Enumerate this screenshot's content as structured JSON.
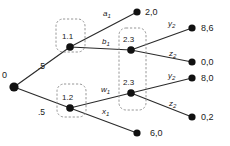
{
  "diagram": {
    "type": "extensive-form-game-tree",
    "root": {
      "label": "0",
      "x": 14,
      "y": 87
    },
    "chance_probabilities": [
      {
        "label": ".5",
        "x": 38,
        "y": 62,
        "branch": "root-to-1.1"
      },
      {
        "label": ".5",
        "x": 38,
        "y": 108,
        "branch": "root-to-1.2"
      }
    ],
    "decision_nodes": [
      {
        "name": "1.1",
        "label": "1.1",
        "x": 70,
        "y": 47,
        "box": {
          "x": 56,
          "y": 19,
          "w": 29,
          "h": 33
        }
      },
      {
        "name": "1.2",
        "label": "1.2",
        "x": 70,
        "y": 108,
        "box": {
          "x": 57,
          "y": 84,
          "w": 29,
          "h": 33
        }
      },
      {
        "name": "2.3-upper",
        "label": "2.3",
        "x": 131,
        "y": 50
      },
      {
        "name": "2.3-lower",
        "label": "2.3",
        "x": 131,
        "y": 93
      }
    ],
    "information_set_box": {
      "x": 119,
      "y": 28,
      "w": 27,
      "h": 82,
      "members": [
        "2.3-upper",
        "2.3-lower"
      ]
    },
    "action_labels": [
      {
        "id": "a1",
        "base": "a",
        "sub": "1",
        "x": 103,
        "y": 10
      },
      {
        "id": "b1",
        "base": "b",
        "sub": "1",
        "x": 102,
        "y": 38
      },
      {
        "id": "w1",
        "base": "w",
        "sub": "1",
        "x": 101,
        "y": 86
      },
      {
        "id": "x1",
        "base": "x",
        "sub": "1",
        "x": 102,
        "y": 108
      },
      {
        "id": "y2-upper",
        "base": "y",
        "sub": "2",
        "x": 168,
        "y": 20
      },
      {
        "id": "z2-upper",
        "base": "z",
        "sub": "2",
        "x": 169,
        "y": 50
      },
      {
        "id": "y2-lower",
        "base": "y",
        "sub": "2",
        "x": 168,
        "y": 72
      },
      {
        "id": "z2-lower",
        "base": "z",
        "sub": "2",
        "x": 169,
        "y": 100
      }
    ],
    "terminal_nodes": [
      {
        "id": "t1",
        "payoff": "2,0",
        "dot_x": 137,
        "dot_y": 12,
        "label_x": 145,
        "label_y": 8
      },
      {
        "id": "t2",
        "payoff": "8,6",
        "dot_x": 192,
        "dot_y": 28,
        "label_x": 201,
        "label_y": 24
      },
      {
        "id": "t3",
        "payoff": "0,0",
        "dot_x": 192,
        "dot_y": 62,
        "label_x": 201,
        "label_y": 58
      },
      {
        "id": "t4",
        "payoff": "8,0",
        "dot_x": 192,
        "dot_y": 78,
        "label_x": 201,
        "label_y": 74
      },
      {
        "id": "t5",
        "payoff": "0,2",
        "dot_x": 192,
        "dot_y": 117,
        "label_x": 201,
        "label_y": 113
      },
      {
        "id": "t6",
        "payoff": "6,0",
        "dot_x": 137,
        "dot_y": 133,
        "label_x": 150,
        "label_y": 129
      }
    ],
    "edges": [
      {
        "from": [
          14,
          87
        ],
        "to": [
          70,
          47
        ],
        "name": "root-to-node-1-1"
      },
      {
        "from": [
          14,
          87
        ],
        "to": [
          70,
          108
        ],
        "name": "root-to-node-1-2"
      },
      {
        "from": [
          70,
          47
        ],
        "to": [
          137,
          12
        ],
        "name": "node-1-1-action-a1"
      },
      {
        "from": [
          70,
          47
        ],
        "to": [
          131,
          50
        ],
        "name": "node-1-1-action-b1"
      },
      {
        "from": [
          70,
          108
        ],
        "to": [
          131,
          93
        ],
        "name": "node-1-2-action-w1"
      },
      {
        "from": [
          70,
          108
        ],
        "to": [
          137,
          133
        ],
        "name": "node-1-2-action-x1"
      },
      {
        "from": [
          131,
          50
        ],
        "to": [
          192,
          28
        ],
        "name": "node-2-3-upper-action-y2"
      },
      {
        "from": [
          131,
          50
        ],
        "to": [
          192,
          62
        ],
        "name": "node-2-3-upper-action-z2"
      },
      {
        "from": [
          131,
          93
        ],
        "to": [
          192,
          78
        ],
        "name": "node-2-3-lower-action-y2"
      },
      {
        "from": [
          131,
          93
        ],
        "to": [
          192,
          117
        ],
        "name": "node-2-3-lower-action-z2"
      }
    ],
    "colors": {
      "node_fill": "#111111",
      "edge": "#2b2b2b",
      "dashed_box": "#8a8a8a",
      "text": "#1a1a1a",
      "background": "#ffffff"
    }
  }
}
